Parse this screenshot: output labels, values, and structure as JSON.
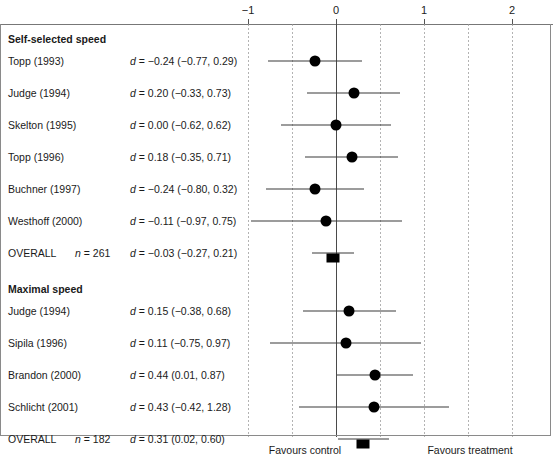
{
  "chart_data": {
    "type": "forest",
    "title": "",
    "xlabel": "",
    "ylabel": "",
    "effect_measure": "d",
    "xlim": [
      -1.45,
      2.47
    ],
    "axis_ticks": [
      {
        "value": -1,
        "label": "−1"
      },
      {
        "value": 0,
        "label": "0"
      },
      {
        "value": 1,
        "label": "1"
      },
      {
        "value": 2,
        "label": "2"
      }
    ],
    "gridlines": [
      -1,
      -0.5,
      0.5,
      1,
      1.5,
      2
    ],
    "reference_line": 0,
    "footer": {
      "left_label": "Favours control",
      "right_label": "Favours treatment"
    },
    "groups": [
      {
        "heading": "Self-selected speed",
        "studies": [
          {
            "label": "Topp (1993)",
            "n": "",
            "d": -0.24,
            "lower": -0.77,
            "upper": 0.29,
            "text": "d = −0.24 (−0.77, 0.29)",
            "marker": "circle"
          },
          {
            "label": "Judge (1994)",
            "n": "",
            "d": 0.2,
            "lower": -0.33,
            "upper": 0.73,
            "text": "d = 0.20 (−0.33, 0.73)",
            "marker": "circle"
          },
          {
            "label": "Skelton (1995)",
            "n": "",
            "d": 0.0,
            "lower": -0.62,
            "upper": 0.62,
            "text": "d = 0.00 (−0.62, 0.62)",
            "marker": "circle"
          },
          {
            "label": "Topp (1996)",
            "n": "",
            "d": 0.18,
            "lower": -0.35,
            "upper": 0.71,
            "text": "d = 0.18 (−0.35, 0.71)",
            "marker": "circle"
          },
          {
            "label": "Buchner (1997)",
            "n": "",
            "d": -0.24,
            "lower": -0.8,
            "upper": 0.32,
            "text": "d = −0.24 (−0.80, 0.32)",
            "marker": "circle"
          },
          {
            "label": "Westhoff (2000)",
            "n": "",
            "d": -0.11,
            "lower": -0.97,
            "upper": 0.75,
            "text": "d = −0.11 (−0.97, 0.75)",
            "marker": "circle"
          },
          {
            "label": "OVERALL",
            "n": "n = 261",
            "d": -0.03,
            "lower": -0.27,
            "upper": 0.21,
            "text": "d = −0.03 (−0.27, 0.21)",
            "marker": "square"
          }
        ]
      },
      {
        "heading": "Maximal speed",
        "studies": [
          {
            "label": "Judge (1994)",
            "n": "",
            "d": 0.15,
            "lower": -0.38,
            "upper": 0.68,
            "text": "d = 0.15 (−0.38, 0.68)",
            "marker": "circle"
          },
          {
            "label": "Sipila (1996)",
            "n": "",
            "d": 0.11,
            "lower": -0.75,
            "upper": 0.97,
            "text": "d = 0.11 (−0.75, 0.97)",
            "marker": "circle"
          },
          {
            "label": "Brandon (2000)",
            "n": "",
            "d": 0.44,
            "lower": 0.01,
            "upper": 0.87,
            "text": "d = 0.44 (0.01, 0.87)",
            "marker": "circle"
          },
          {
            "label": "Schlicht (2001)",
            "n": "",
            "d": 0.43,
            "lower": -0.42,
            "upper": 1.28,
            "text": "d = 0.43 (−0.42, 1.28)",
            "marker": "circle"
          },
          {
            "label": "OVERALL",
            "n": "n = 182",
            "d": 0.31,
            "lower": 0.02,
            "upper": 0.6,
            "text": "d = 0.31 (0.02, 0.60)",
            "marker": "square"
          }
        ]
      }
    ]
  },
  "colors": {
    "marker": "#000000",
    "whisker": "#3a3a3a",
    "reference": "#4a4a4a",
    "grid": "#9a9a9a",
    "frame": "#8a8a8a",
    "text": "#1a1a1a"
  }
}
